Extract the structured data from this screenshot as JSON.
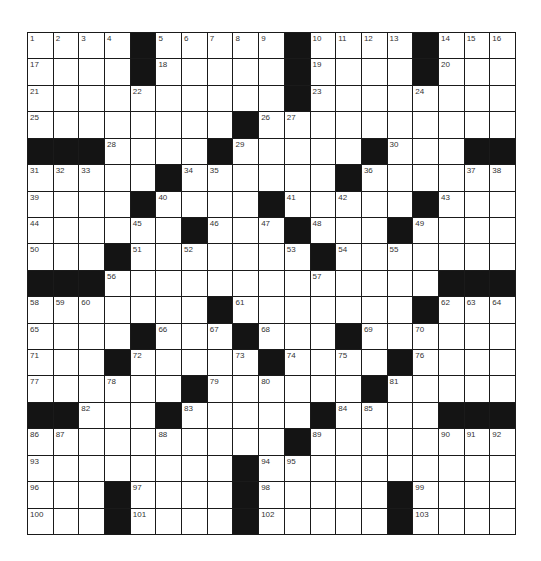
{
  "puzzle": {
    "rows": 19,
    "cols": 19,
    "colors": {
      "block": "#141414",
      "cell": "#ffffff",
      "line": "#1a1a1a",
      "number": "#333333"
    },
    "grid": [
      "....#.....#....#...",
      "....#.....#....#...",
      "..........#........",
      "........#..........",
      "###....#.....#...##",
      ".....#......#......",
      "....#....#.....#...",
      "......#...#...#....",
      "...#.......#.......",
      "###.............###",
      ".......#.......#...",
      "....#...#...#......",
      "...#.....#....#....",
      "......#......#.....",
      "##...#.....#....###",
      "..........#........",
      "........#..........",
      "...#....#.....#....",
      "...#....#.....#...."
    ],
    "numbers": [
      {
        "r": 0,
        "c": 0,
        "n": "1"
      },
      {
        "r": 0,
        "c": 1,
        "n": "2"
      },
      {
        "r": 0,
        "c": 2,
        "n": "3"
      },
      {
        "r": 0,
        "c": 3,
        "n": "4"
      },
      {
        "r": 0,
        "c": 5,
        "n": "5"
      },
      {
        "r": 0,
        "c": 6,
        "n": "6"
      },
      {
        "r": 0,
        "c": 7,
        "n": "7"
      },
      {
        "r": 0,
        "c": 8,
        "n": "8"
      },
      {
        "r": 0,
        "c": 9,
        "n": "9"
      },
      {
        "r": 0,
        "c": 11,
        "n": "10"
      },
      {
        "r": 0,
        "c": 12,
        "n": "11"
      },
      {
        "r": 0,
        "c": 13,
        "n": "12"
      },
      {
        "r": 0,
        "c": 14,
        "n": "13"
      },
      {
        "r": 0,
        "c": 16,
        "n": "14"
      },
      {
        "r": 0,
        "c": 17,
        "n": "15"
      },
      {
        "r": 0,
        "c": 18,
        "n": "16"
      },
      {
        "r": 1,
        "c": 0,
        "n": "17"
      },
      {
        "r": 1,
        "c": 5,
        "n": "18"
      },
      {
        "r": 1,
        "c": 11,
        "n": "19"
      },
      {
        "r": 1,
        "c": 16,
        "n": "20"
      },
      {
        "r": 2,
        "c": 0,
        "n": "21"
      },
      {
        "r": 2,
        "c": 4,
        "n": "22"
      },
      {
        "r": 2,
        "c": 11,
        "n": "23"
      },
      {
        "r": 2,
        "c": 15,
        "n": "24"
      },
      {
        "r": 3,
        "c": 0,
        "n": "25"
      },
      {
        "r": 3,
        "c": 9,
        "n": "26"
      },
      {
        "r": 3,
        "c": 10,
        "n": "27"
      },
      {
        "r": 4,
        "c": 3,
        "n": "28"
      },
      {
        "r": 4,
        "c": 8,
        "n": "29"
      },
      {
        "r": 4,
        "c": 14,
        "n": "30"
      },
      {
        "r": 5,
        "c": 0,
        "n": "31"
      },
      {
        "r": 5,
        "c": 1,
        "n": "32"
      },
      {
        "r": 5,
        "c": 2,
        "n": "33"
      },
      {
        "r": 5,
        "c": 6,
        "n": "34"
      },
      {
        "r": 5,
        "c": 7,
        "n": "35"
      },
      {
        "r": 5,
        "c": 13,
        "n": "36"
      },
      {
        "r": 5,
        "c": 17,
        "n": "37"
      },
      {
        "r": 5,
        "c": 18,
        "n": "38"
      },
      {
        "r": 6,
        "c": 0,
        "n": "39"
      },
      {
        "r": 6,
        "c": 5,
        "n": "40"
      },
      {
        "r": 6,
        "c": 10,
        "n": "41"
      },
      {
        "r": 6,
        "c": 12,
        "n": "42"
      },
      {
        "r": 6,
        "c": 16,
        "n": "43"
      },
      {
        "r": 7,
        "c": 0,
        "n": "44"
      },
      {
        "r": 7,
        "c": 4,
        "n": "45"
      },
      {
        "r": 7,
        "c": 7,
        "n": "46"
      },
      {
        "r": 7,
        "c": 9,
        "n": "47"
      },
      {
        "r": 7,
        "c": 11,
        "n": "48"
      },
      {
        "r": 7,
        "c": 15,
        "n": "49"
      },
      {
        "r": 8,
        "c": 0,
        "n": "50"
      },
      {
        "r": 8,
        "c": 4,
        "n": "51"
      },
      {
        "r": 8,
        "c": 6,
        "n": "52"
      },
      {
        "r": 8,
        "c": 10,
        "n": "53"
      },
      {
        "r": 8,
        "c": 12,
        "n": "54"
      },
      {
        "r": 8,
        "c": 14,
        "n": "55"
      },
      {
        "r": 9,
        "c": 3,
        "n": "56"
      },
      {
        "r": 9,
        "c": 11,
        "n": "57"
      },
      {
        "r": 10,
        "c": 0,
        "n": "58"
      },
      {
        "r": 10,
        "c": 1,
        "n": "59"
      },
      {
        "r": 10,
        "c": 2,
        "n": "60"
      },
      {
        "r": 10,
        "c": 8,
        "n": "61"
      },
      {
        "r": 10,
        "c": 16,
        "n": "62"
      },
      {
        "r": 10,
        "c": 17,
        "n": "63"
      },
      {
        "r": 10,
        "c": 18,
        "n": "64"
      },
      {
        "r": 11,
        "c": 0,
        "n": "65"
      },
      {
        "r": 11,
        "c": 5,
        "n": "66"
      },
      {
        "r": 11,
        "c": 7,
        "n": "67"
      },
      {
        "r": 11,
        "c": 9,
        "n": "68"
      },
      {
        "r": 11,
        "c": 13,
        "n": "69"
      },
      {
        "r": 11,
        "c": 15,
        "n": "70"
      },
      {
        "r": 12,
        "c": 0,
        "n": "71"
      },
      {
        "r": 12,
        "c": 4,
        "n": "72"
      },
      {
        "r": 12,
        "c": 8,
        "n": "73"
      },
      {
        "r": 12,
        "c": 10,
        "n": "74"
      },
      {
        "r": 12,
        "c": 12,
        "n": "75"
      },
      {
        "r": 12,
        "c": 15,
        "n": "76"
      },
      {
        "r": 13,
        "c": 0,
        "n": "77"
      },
      {
        "r": 13,
        "c": 3,
        "n": "78"
      },
      {
        "r": 13,
        "c": 7,
        "n": "79"
      },
      {
        "r": 13,
        "c": 9,
        "n": "80"
      },
      {
        "r": 13,
        "c": 14,
        "n": "81"
      },
      {
        "r": 14,
        "c": 2,
        "n": "82"
      },
      {
        "r": 14,
        "c": 6,
        "n": "83"
      },
      {
        "r": 14,
        "c": 12,
        "n": "84"
      },
      {
        "r": 14,
        "c": 13,
        "n": "85"
      },
      {
        "r": 15,
        "c": 0,
        "n": "86"
      },
      {
        "r": 15,
        "c": 1,
        "n": "87"
      },
      {
        "r": 15,
        "c": 5,
        "n": "88"
      },
      {
        "r": 15,
        "c": 11,
        "n": "89"
      },
      {
        "r": 15,
        "c": 16,
        "n": "90"
      },
      {
        "r": 15,
        "c": 17,
        "n": "91"
      },
      {
        "r": 15,
        "c": 18,
        "n": "92"
      },
      {
        "r": 16,
        "c": 0,
        "n": "93"
      },
      {
        "r": 16,
        "c": 9,
        "n": "94"
      },
      {
        "r": 16,
        "c": 10,
        "n": "95"
      },
      {
        "r": 17,
        "c": 0,
        "n": "96"
      },
      {
        "r": 17,
        "c": 4,
        "n": "97"
      },
      {
        "r": 17,
        "c": 9,
        "n": "98"
      },
      {
        "r": 17,
        "c": 15,
        "n": "99"
      },
      {
        "r": 18,
        "c": 0,
        "n": "100"
      },
      {
        "r": 18,
        "c": 4,
        "n": "101"
      },
      {
        "r": 18,
        "c": 9,
        "n": "102"
      },
      {
        "r": 18,
        "c": 15,
        "n": "103"
      }
    ]
  }
}
